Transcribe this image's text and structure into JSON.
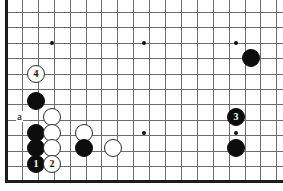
{
  "figure": {
    "kind": "go-board-diagram",
    "width": 283,
    "height": 191,
    "background_color": "#ffffff",
    "board": {
      "line_color": "#6d6d6d",
      "edge_color": "#1c1c1c",
      "edge_thickness": 3,
      "grid_spacing_x": 15.9,
      "grid_spacing_y": 15.4,
      "origin_x": 6,
      "origin_y": 12,
      "columns": 18,
      "rows": 11,
      "left_edge_x": 6,
      "bottom_edge_y": 180,
      "edges_shown": [
        "left",
        "bottom"
      ]
    },
    "star_points": [
      {
        "name": "star-point-left",
        "x": 52,
        "y": 43
      },
      {
        "name": "star-point-center",
        "x": 144,
        "y": 43
      },
      {
        "name": "star-point-right",
        "x": 236,
        "y": 43
      },
      {
        "name": "star-point-lower-center",
        "x": 144,
        "y": 133
      },
      {
        "name": "star-point-lower-right",
        "x": 236,
        "y": 133
      }
    ],
    "stones": [
      {
        "id": "white-move-4",
        "color": "white",
        "x": 36,
        "y": 74,
        "radius": 9,
        "label": "4",
        "label_size": 10
      },
      {
        "id": "black-upper-left",
        "color": "black",
        "x": 36,
        "y": 101,
        "radius": 9,
        "label": "",
        "label_size": 0
      },
      {
        "id": "white-left-a-row",
        "color": "white",
        "x": 52,
        "y": 117,
        "radius": 9,
        "label": "",
        "label_size": 0
      },
      {
        "id": "black-left-mid",
        "color": "black",
        "x": 36,
        "y": 133,
        "radius": 9,
        "label": "",
        "label_size": 0
      },
      {
        "id": "white-left-mid",
        "color": "white",
        "x": 52,
        "y": 133,
        "radius": 9,
        "label": "",
        "label_size": 0
      },
      {
        "id": "black-left-low",
        "color": "black",
        "x": 36,
        "y": 148,
        "radius": 9,
        "label": "",
        "label_size": 0
      },
      {
        "id": "white-left-low",
        "color": "white",
        "x": 52,
        "y": 148,
        "radius": 9,
        "label": "",
        "label_size": 0
      },
      {
        "id": "black-move-1",
        "color": "black",
        "x": 36,
        "y": 164,
        "radius": 9,
        "label": "1",
        "label_size": 10
      },
      {
        "id": "white-move-2",
        "color": "white",
        "x": 52,
        "y": 164,
        "radius": 9,
        "label": "2",
        "label_size": 10
      },
      {
        "id": "white-center-upper",
        "color": "white",
        "x": 84,
        "y": 133,
        "radius": 9,
        "label": "",
        "label_size": 0
      },
      {
        "id": "black-center",
        "color": "black",
        "x": 84,
        "y": 148,
        "radius": 9,
        "label": "",
        "label_size": 0
      },
      {
        "id": "white-center-right",
        "color": "white",
        "x": 113,
        "y": 148,
        "radius": 9,
        "label": "",
        "label_size": 0
      },
      {
        "id": "black-upper-right",
        "color": "black",
        "x": 251,
        "y": 58,
        "radius": 9,
        "label": "",
        "label_size": 0
      },
      {
        "id": "black-move-3",
        "color": "black",
        "x": 236,
        "y": 117,
        "radius": 9,
        "label": "3",
        "label_size": 10
      },
      {
        "id": "black-right-low",
        "color": "black",
        "x": 236,
        "y": 148,
        "radius": 9,
        "label": "",
        "label_size": 0
      }
    ],
    "point_labels": [
      {
        "id": "point-label-a",
        "text": "a",
        "x": 20,
        "y": 117,
        "font_size": 11
      }
    ]
  }
}
